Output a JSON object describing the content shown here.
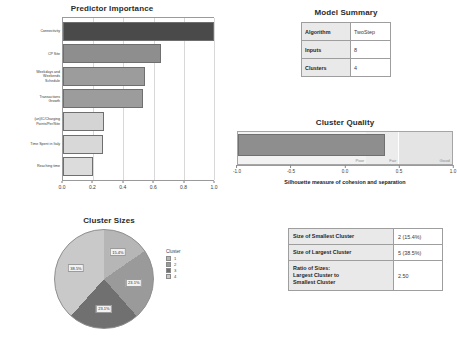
{
  "chart_data": [
    {
      "type": "bar",
      "title": "Predictor Importance",
      "orientation": "horizontal",
      "xlabel": "",
      "ylabel": "",
      "xlim": [
        0.0,
        1.0
      ],
      "grid": true,
      "xticks": [
        "0.0",
        "0.2",
        "0.4",
        "0.6",
        "0.8",
        "1.0"
      ],
      "categories": [
        "Connectivity",
        "CP Site",
        "Weekdays and\nWeekends\nSchedule",
        "Transactions\nGrowth",
        "(un)IC/Charging\nPoints/Per/Site",
        "Time Spent in Italy",
        "Reaching time"
      ],
      "values": [
        1.0,
        0.65,
        0.54,
        0.53,
        0.27,
        0.265,
        0.2
      ],
      "bar_colors": [
        "#4a4a4a",
        "#8e8e8e",
        "#9c9c9c",
        "#9c9c9c",
        "#d4d4d4",
        "#d8d8d8",
        "#dcdcdc"
      ]
    },
    {
      "type": "bar",
      "title": "Cluster Quality",
      "orientation": "horizontal",
      "caption": "Silhouette measure of cohesion and separation",
      "xlim": [
        -1.0,
        1.0
      ],
      "value": 0.37,
      "xticks": [
        "-1.0",
        "-0.5",
        "0.0",
        "0.5",
        "1.0"
      ],
      "bar_color": "#8e8e8e",
      "zones": [
        {
          "label": "Poor",
          "from": -1.0,
          "to": 0.2,
          "color": "#f2f2f2"
        },
        {
          "label": "Fair",
          "from": 0.2,
          "to": 0.5,
          "color": "#ececec"
        },
        {
          "label": "Good",
          "from": 0.5,
          "to": 1.0,
          "color": "#e4e4e4"
        }
      ]
    },
    {
      "type": "pie",
      "title": "Cluster Sizes",
      "legend_title": "Cluster",
      "legend_position": "right",
      "categories": [
        "1",
        "2",
        "3",
        "4"
      ],
      "values": [
        15.4,
        23.1,
        23.1,
        38.5
      ],
      "slice_labels": [
        "15.4%",
        "23.1%",
        "23.1%",
        "38.5%"
      ],
      "slice_colors": [
        "#b6b6b6",
        "#9a9a9a",
        "#707070",
        "#c9c9c9"
      ]
    }
  ],
  "predictor_importance": {
    "title": "Predictor Importance",
    "xticks": [
      "0.0",
      "0.2",
      "0.4",
      "0.6",
      "0.8",
      "1.0"
    ],
    "bars": [
      {
        "label": "Connectivity",
        "value": 1.0,
        "color": "#4a4a4a"
      },
      {
        "label": "CP Site",
        "value": 0.65,
        "color": "#8e8e8e"
      },
      {
        "label": "Weekdays and\nWeekends\nSchedule",
        "value": 0.54,
        "color": "#9c9c9c"
      },
      {
        "label": "Transactions\nGrowth",
        "value": 0.53,
        "color": "#9c9c9c"
      },
      {
        "label": "(un)IC/Charging\nPoints/Per/Site",
        "value": 0.27,
        "color": "#d4d4d4"
      },
      {
        "label": "Time Spent in Italy",
        "value": 0.265,
        "color": "#d8d8d8"
      },
      {
        "label": "Reaching time",
        "value": 0.2,
        "color": "#dcdcdc"
      }
    ]
  },
  "model_summary": {
    "title": "Model Summary",
    "rows": [
      {
        "key": "Algorithm",
        "value": "TwoStep"
      },
      {
        "key": "Inputs",
        "value": "8"
      },
      {
        "key": "Clusters",
        "value": "4"
      }
    ]
  },
  "cluster_quality": {
    "title": "Cluster Quality",
    "caption": "Silhouette measure of cohesion and separation",
    "value": 0.37,
    "xticks": [
      "-1.0",
      "-0.5",
      "0.0",
      "0.5",
      "1.0"
    ],
    "zones": [
      {
        "label": "Poor"
      },
      {
        "label": "Fair"
      },
      {
        "label": "Good"
      }
    ]
  },
  "cluster_sizes": {
    "title": "Cluster Sizes",
    "legend_title": "Cluster",
    "legend": [
      {
        "label": "1",
        "color": "#b6b6b6"
      },
      {
        "label": "2",
        "color": "#9a9a9a"
      },
      {
        "label": "3",
        "color": "#707070"
      },
      {
        "label": "4",
        "color": "#c9c9c9"
      }
    ],
    "slices": [
      {
        "label": "15.4%",
        "value": 15.4,
        "color": "#b6b6b6"
      },
      {
        "label": "23.1%",
        "value": 23.1,
        "color": "#9a9a9a"
      },
      {
        "label": "23.1%",
        "value": 23.1,
        "color": "#707070"
      },
      {
        "label": "38.5%",
        "value": 38.5,
        "color": "#c9c9c9"
      }
    ]
  },
  "size_summary": {
    "rows": [
      {
        "key": "Size of Smallest Cluster",
        "value": "2 (15.4%)"
      },
      {
        "key": "Size of Largest Cluster",
        "value": "5 (38.5%)"
      },
      {
        "key": "Ratio of Sizes:\nLargest Cluster to\nSmallest Cluster",
        "value": "2.50"
      }
    ]
  }
}
